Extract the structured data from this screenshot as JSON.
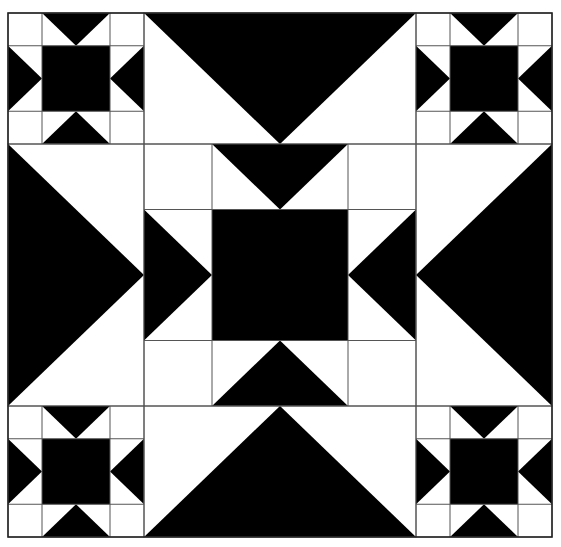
{
  "colors": {
    "dark": "#000000",
    "light": "#ffffff",
    "seam": "#555555"
  },
  "block": {
    "x0": 8,
    "y0": 13,
    "x1": 552,
    "y1": 537,
    "cols": [
      8,
      144,
      416,
      552
    ],
    "rows": [
      13,
      144,
      406,
      537
    ]
  },
  "regions": [
    {
      "id": "corner-top-left",
      "type": "small-star",
      "col": 0,
      "row": 0
    },
    {
      "id": "top-middle",
      "type": "flying-geese-down",
      "col": 1,
      "row": 0
    },
    {
      "id": "corner-top-right",
      "type": "small-star",
      "col": 2,
      "row": 0
    },
    {
      "id": "middle-left",
      "type": "flying-geese-right",
      "col": 0,
      "row": 1
    },
    {
      "id": "center",
      "type": "large-star",
      "col": 1,
      "row": 1
    },
    {
      "id": "middle-right",
      "type": "flying-geese-left",
      "col": 2,
      "row": 1
    },
    {
      "id": "corner-bottom-left",
      "type": "small-star",
      "col": 0,
      "row": 2
    },
    {
      "id": "bottom-middle",
      "type": "flying-geese-up",
      "col": 1,
      "row": 2
    },
    {
      "id": "corner-bottom-right",
      "type": "small-star",
      "col": 2,
      "row": 2
    }
  ]
}
